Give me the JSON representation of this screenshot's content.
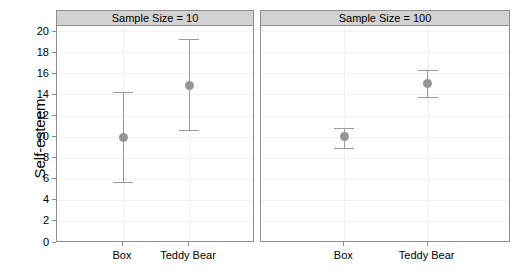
{
  "chart_data": {
    "type": "scatter",
    "title": "",
    "subtitle": "",
    "xlabel": "",
    "ylabel": "Self-esteem",
    "ylim": [
      0,
      20.5
    ],
    "yticks": [
      0,
      2,
      4,
      6,
      8,
      10,
      12,
      14,
      16,
      18,
      20
    ],
    "ytick_labels": [
      "0",
      "2",
      "4",
      "6",
      "8",
      "10",
      "12",
      "14",
      "16",
      "18",
      "20"
    ],
    "categories": [
      "Box",
      "Teddy Bear"
    ],
    "grid": true,
    "legend": "none",
    "error_bar_style": "95% confidence interval",
    "point_color": "#969696",
    "errorbar_color": "#9b9b9b",
    "panel_strip_color": "#d2d2d2",
    "panel_border_color": "#8e8e8e",
    "gridline_color": "#f1f1f1",
    "panels": [
      {
        "strip_label": "Sample Size = 10",
        "points": [
          {
            "category": "Box",
            "mean": 9.9,
            "lower": 5.7,
            "upper": 14.2
          },
          {
            "category": "Teddy Bear",
            "mean": 14.9,
            "lower": 10.6,
            "upper": 19.3
          }
        ]
      },
      {
        "strip_label": "Sample Size = 100",
        "points": [
          {
            "category": "Box",
            "mean": 10.0,
            "lower": 8.9,
            "upper": 10.8
          },
          {
            "category": "Teddy Bear",
            "mean": 15.0,
            "lower": 13.8,
            "upper": 16.3
          }
        ]
      }
    ]
  }
}
